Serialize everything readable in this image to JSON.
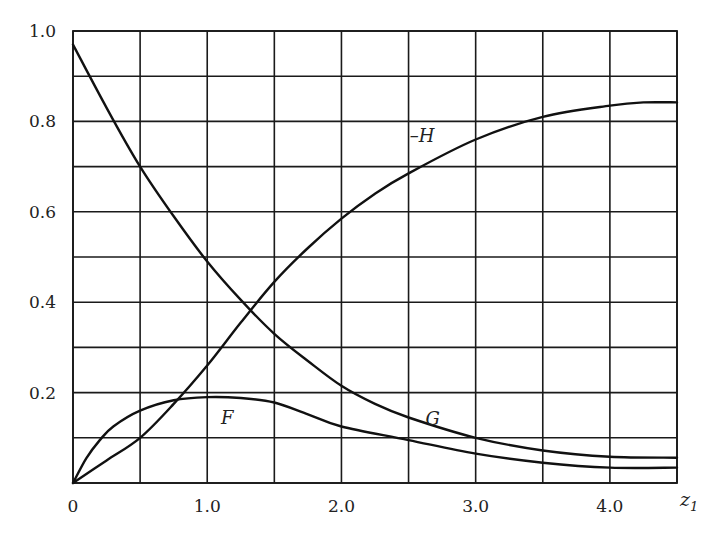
{
  "chart_data": {
    "type": "line",
    "title": "",
    "xlabel": "z1",
    "xlabel_main": "z",
    "xlabel_sub": "1",
    "ylabel": "",
    "xlim": [
      0,
      4.5
    ],
    "ylim": [
      0,
      1.0
    ],
    "grid": true,
    "grid_x_step": 0.5,
    "grid_y_step": 0.1,
    "x_ticks": [
      {
        "value": 0,
        "label": "0"
      },
      {
        "value": 1.0,
        "label": "1.0"
      },
      {
        "value": 2.0,
        "label": "2.0"
      },
      {
        "value": 3.0,
        "label": "3.0"
      },
      {
        "value": 4.0,
        "label": "4.0"
      }
    ],
    "y_ticks": [
      {
        "value": 0.2,
        "label": "0.2"
      },
      {
        "value": 0.4,
        "label": "0.4"
      },
      {
        "value": 0.6,
        "label": "0.6"
      },
      {
        "value": 0.8,
        "label": "0.8"
      },
      {
        "value": 1.0,
        "label": "1.0"
      }
    ],
    "legend": "inline curve labels",
    "series": [
      {
        "name": "F",
        "label": "F",
        "label_pos": {
          "x": 1.15,
          "y": 0.13
        },
        "x": [
          0,
          0.1,
          0.2,
          0.3,
          0.5,
          0.75,
          1.0,
          1.25,
          1.5,
          1.75,
          2.0,
          2.5,
          3.0,
          3.5,
          4.0,
          4.5
        ],
        "y": [
          0,
          0.055,
          0.095,
          0.125,
          0.16,
          0.183,
          0.19,
          0.188,
          0.178,
          0.152,
          0.125,
          0.095,
          0.065,
          0.045,
          0.034,
          0.034
        ]
      },
      {
        "name": "G",
        "label": "G",
        "label_pos": {
          "x": 2.68,
          "y": 0.128
        },
        "x": [
          0,
          0.25,
          0.5,
          0.75,
          1.0,
          1.25,
          1.5,
          1.75,
          2.0,
          2.25,
          2.5,
          3.0,
          3.5,
          4.0,
          4.5
        ],
        "y": [
          0.97,
          0.83,
          0.7,
          0.59,
          0.49,
          0.405,
          0.33,
          0.27,
          0.215,
          0.175,
          0.145,
          0.1,
          0.072,
          0.058,
          0.056
        ]
      },
      {
        "name": "-H",
        "label": "–H",
        "label_pos": {
          "x": 2.6,
          "y": 0.755
        },
        "x": [
          0,
          0.25,
          0.5,
          0.75,
          1.0,
          1.25,
          1.5,
          1.75,
          2.0,
          2.25,
          2.5,
          3.0,
          3.5,
          4.0,
          4.25,
          4.5
        ],
        "y": [
          0,
          0.05,
          0.1,
          0.175,
          0.26,
          0.355,
          0.445,
          0.52,
          0.585,
          0.64,
          0.685,
          0.76,
          0.81,
          0.835,
          0.842,
          0.842
        ]
      }
    ]
  }
}
